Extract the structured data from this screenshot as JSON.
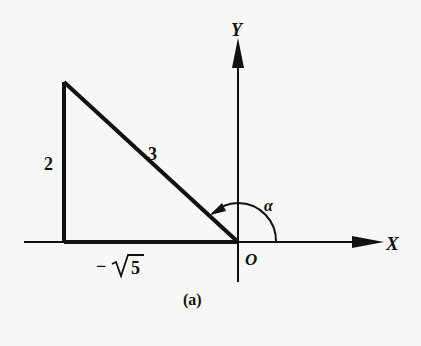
{
  "diagram": {
    "caption": "(a)",
    "axes": {
      "x_label": "X",
      "y_label": "Y",
      "origin_label": "O"
    },
    "triangle": {
      "vertical_side_label": "2",
      "hypotenuse_label": "3",
      "horizontal_side_label": "−√5",
      "horizontal_minus": "−",
      "horizontal_radicand": "5"
    },
    "angle": {
      "label": "α"
    },
    "colors": {
      "background": "#f7f7f5",
      "ink": "#111111"
    }
  }
}
